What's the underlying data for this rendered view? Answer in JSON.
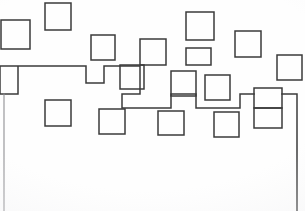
{
  "image": {
    "title": "Abstract orthogonal line drawing",
    "description": "Scattered outlined squares across the upper half of a white sheet, linked by a continuous stepped right-angle polyline; the lower half is blank.",
    "medium": "ink line art on white paper",
    "width": 305,
    "height": 211,
    "background_color": "#fefefe",
    "stroke_color": "#3b3b3b",
    "faint_stroke_color": "#8f8f93",
    "stroke_width": 1.5,
    "shape_count": 19,
    "path_count": 3
  },
  "geometry": {
    "squares": [
      {
        "name": "square-top-left-edge",
        "x": 1,
        "y": 20,
        "w": 29,
        "h": 29
      },
      {
        "name": "square-upper-row-1",
        "x": 45,
        "y": 3,
        "w": 26,
        "h": 27
      },
      {
        "name": "square-upper-row-2",
        "x": 91,
        "y": 35,
        "w": 24,
        "h": 25
      },
      {
        "name": "square-upper-row-3",
        "x": 140,
        "y": 39,
        "w": 26,
        "h": 26
      },
      {
        "name": "square-upper-row-4",
        "x": 186,
        "y": 12,
        "w": 28,
        "h": 28
      },
      {
        "name": "square-upper-row-5",
        "x": 235,
        "y": 31,
        "w": 26,
        "h": 26
      },
      {
        "name": "square-upper-row-6",
        "x": 277,
        "y": 55,
        "w": 25,
        "h": 25
      },
      {
        "name": "square-mid-row-1",
        "x": 120,
        "y": 65,
        "w": 24,
        "h": 24
      },
      {
        "name": "square-mid-row-2",
        "x": 171,
        "y": 71,
        "w": 25,
        "h": 25
      },
      {
        "name": "square-mid-row-3",
        "x": 205,
        "y": 75,
        "w": 25,
        "h": 25
      },
      {
        "name": "square-mid-row-4",
        "x": 186,
        "y": 48,
        "w": 25,
        "h": 17
      },
      {
        "name": "square-lower-row-1",
        "x": 45,
        "y": 100,
        "w": 26,
        "h": 26
      },
      {
        "name": "square-lower-row-2",
        "x": 99,
        "y": 109,
        "w": 26,
        "h": 25
      },
      {
        "name": "square-lower-row-3",
        "x": 158,
        "y": 111,
        "w": 26,
        "h": 24
      },
      {
        "name": "square-lower-row-4",
        "x": 214,
        "y": 112,
        "w": 25,
        "h": 25
      },
      {
        "name": "square-right-stack-top",
        "x": 254,
        "y": 88,
        "w": 28,
        "h": 20
      },
      {
        "name": "square-right-stack-bottom",
        "x": 254,
        "y": 108,
        "w": 28,
        "h": 20
      }
    ],
    "paths": [
      {
        "name": "main-stepped-polyline",
        "d": "M 0 66 L 0 66 L 0 94 L 18 94 L 18 66 L 0 66 M 0 66 L 86 66 L 86 83 L 104 83 L 104 66 L 140 66 L 140 94 L 122 94 L 122 108 L 171 108 L 171 94 L 196 94 L 196 108 L 240 108 L 240 94 L 254 94"
      },
      {
        "name": "right-descender",
        "d": "M 282 94 L 297 94 L 297 211"
      },
      {
        "name": "left-descender",
        "d": "M 4 94 L 4 211"
      }
    ]
  },
  "accessibility": {
    "alt_text": "Minimal black-and-white drawing of open squares and right-angle connecting lines arranged across the top of an otherwise empty white page."
  }
}
